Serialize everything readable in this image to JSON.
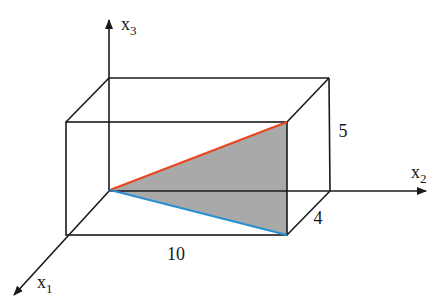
{
  "figure": {
    "axes": {
      "x1": {
        "label": "x",
        "subscript": "1"
      },
      "x2": {
        "label": "x",
        "subscript": "2"
      },
      "x3": {
        "label": "x",
        "subscript": "3"
      }
    },
    "dimensions": {
      "length_x2": "10",
      "depth_x1": "4",
      "height_x3": "5"
    },
    "colors": {
      "edge": "#1a1a1a",
      "triangle_fill": "#a9a9a9",
      "top_diagonal": "#e8461e",
      "bottom_diagonal": "#2a8fd0"
    }
  }
}
